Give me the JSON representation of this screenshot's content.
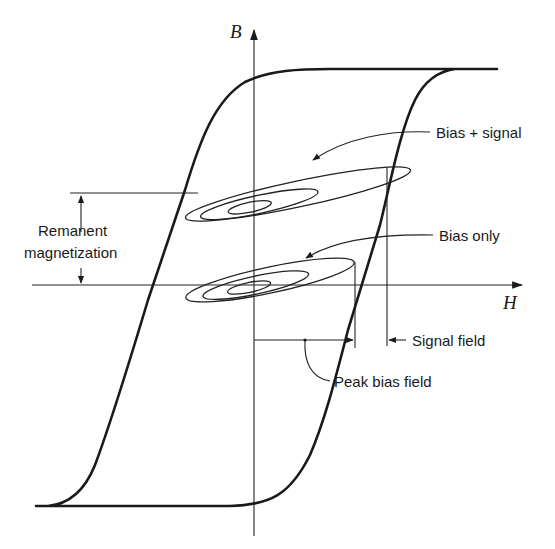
{
  "diagram": {
    "title": "",
    "type": "magnetic hysteresis loop (B-H curve) with AC bias loops",
    "axes": {
      "vertical_label": "B",
      "horizontal_label": "H"
    },
    "labels": {
      "bias_signal": "Bias + signal",
      "bias_only": "Bias only",
      "remanent_line1": "Remanent",
      "remanent_line2": "magnetization",
      "signal_field": "Signal field",
      "peak_bias_field": "Peak bias field"
    },
    "elements": [
      {
        "name": "major-hysteresis-loop",
        "description": "Outer saturating B-H loop"
      },
      {
        "name": "bias-plus-signal-minor-loops",
        "description": "Three nested minor loops centered above H axis"
      },
      {
        "name": "bias-only-minor-loops",
        "description": "Three nested minor loops centered on H axis"
      },
      {
        "name": "remanent-magnetization-dimension",
        "description": "Vertical double arrow between H axis and bias+signal level"
      },
      {
        "name": "peak-bias-field-dimension",
        "description": "Horizontal arrow from B axis to peak bias field"
      },
      {
        "name": "signal-field-dimension",
        "description": "Arrow marking additional signal field offset"
      }
    ],
    "colors": {
      "ink": "#1a1a1a",
      "background": "#ffffff"
    }
  }
}
